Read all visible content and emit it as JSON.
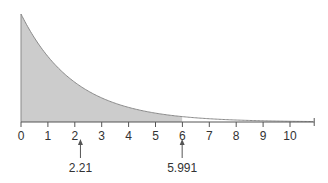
{
  "chart_data": {
    "type": "area",
    "title": "",
    "xlabel": "",
    "ylabel": "",
    "distribution": "chi-square, df=2 (density e^(-x/2)/2)",
    "x_ticks": [
      0,
      1,
      2,
      3,
      4,
      5,
      6,
      7,
      8,
      9,
      10
    ],
    "x_tick_labels": [
      "0",
      "1",
      "2",
      "3",
      "4",
      "5",
      "6",
      "7",
      "8",
      "9",
      "10"
    ],
    "xlim": [
      0,
      10.9
    ],
    "shaded_region": [
      0,
      5.991
    ],
    "grid": false,
    "annotations": [
      {
        "x": 2.21,
        "label": "2.21"
      },
      {
        "x": 5.991,
        "label": "5.991"
      }
    ],
    "colors": {
      "fill": "#cccccc",
      "stroke": "#8a8a8a",
      "axis": "#555555"
    }
  }
}
